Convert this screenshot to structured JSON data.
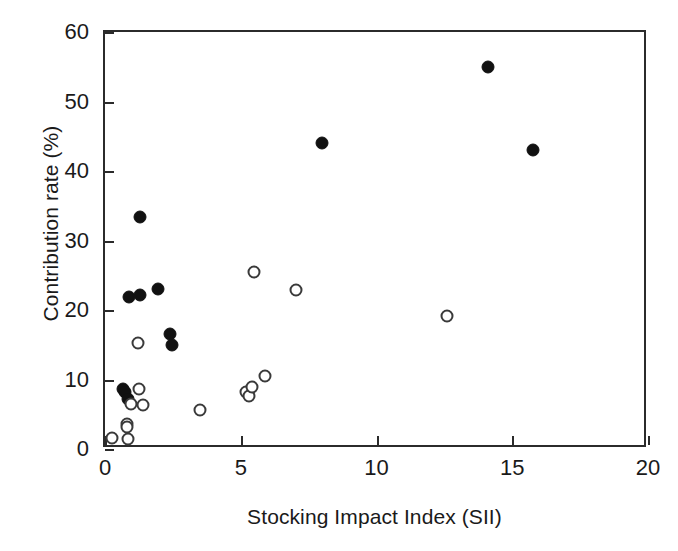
{
  "chart_data": {
    "type": "scatter",
    "title": "",
    "xlabel": "Stocking Impact Index (SII)",
    "ylabel": "Contribution rate (%)",
    "xlim": [
      0,
      20
    ],
    "ylim": [
      0,
      60
    ],
    "xticks": [
      0,
      5,
      10,
      15,
      20
    ],
    "yticks": [
      0,
      10,
      20,
      30,
      40,
      50,
      60
    ],
    "xtick_labels": [
      "0",
      "5",
      "10",
      "15",
      "20"
    ],
    "ytick_labels": [
      "0",
      "10",
      "20",
      "30",
      "40",
      "50",
      "60"
    ],
    "grid": false,
    "legend": "none",
    "series": [
      {
        "name": "filled",
        "marker": "filled-circle",
        "color": "#111111",
        "points": [
          [
            0.65,
            8.6
          ],
          [
            0.75,
            8.2
          ],
          [
            0.85,
            7.2
          ],
          [
            0.9,
            21.9
          ],
          [
            1.3,
            22.1
          ],
          [
            1.3,
            33.4
          ],
          [
            1.95,
            23.0
          ],
          [
            2.4,
            16.5
          ],
          [
            2.45,
            14.9
          ],
          [
            8.0,
            44.0
          ],
          [
            14.1,
            55.0
          ],
          [
            15.75,
            43.0
          ]
        ]
      },
      {
        "name": "open",
        "marker": "open-circle",
        "color": "#3a3a3a",
        "points": [
          [
            0.25,
            1.6
          ],
          [
            0.8,
            3.6
          ],
          [
            0.8,
            3.1
          ],
          [
            0.85,
            1.4
          ],
          [
            0.95,
            6.5
          ],
          [
            1.2,
            15.3
          ],
          [
            1.25,
            8.7
          ],
          [
            1.4,
            6.3
          ],
          [
            3.5,
            5.6
          ],
          [
            5.2,
            8.2
          ],
          [
            5.3,
            7.6
          ],
          [
            5.4,
            8.9
          ],
          [
            5.9,
            10.5
          ],
          [
            5.5,
            25.4
          ],
          [
            7.05,
            22.9
          ],
          [
            12.6,
            19.2
          ]
        ]
      }
    ]
  }
}
